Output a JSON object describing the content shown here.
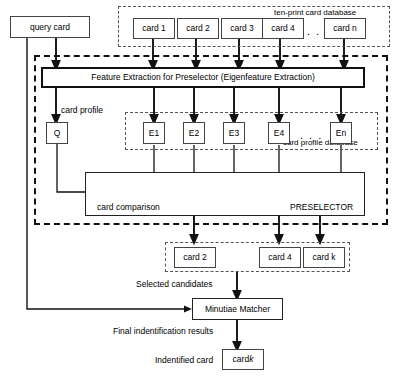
{
  "diagram": {
    "accent": "#000000",
    "box_border": "#444444",
    "dash_border": "#555555"
  },
  "query": {
    "card_label": "query card"
  },
  "tenprint_db": {
    "title": "ten-print card database",
    "cards": [
      {
        "label": "card 1"
      },
      {
        "label": "card 2"
      },
      {
        "label": "card 3"
      },
      {
        "label": "card 4"
      },
      {
        "label": "card n"
      }
    ],
    "ellipsis": ". . ."
  },
  "feature_extraction": {
    "label": "Feature Extraction for Preselector (Eigenfeature Extraction)"
  },
  "profiles": {
    "card_profile_label": "card profile",
    "query_profile": "Q",
    "db_title": "card profile database",
    "entries": [
      {
        "label": "E1"
      },
      {
        "label": "E2"
      },
      {
        "label": "E3"
      },
      {
        "label": "E4"
      },
      {
        "label": "En"
      }
    ],
    "ellipsis": ". . ."
  },
  "preselector": {
    "name": "PRESELECTOR",
    "comparison_label": "card comparison",
    "compare_symbol": "⊗"
  },
  "candidates": {
    "caption": "Selected candidates",
    "cards": [
      {
        "label": "card 2"
      },
      {
        "label": "card 4"
      },
      {
        "label": "card k"
      }
    ]
  },
  "matcher": {
    "label": "Minutiae Matcher",
    "results_caption": "Final indentification results"
  },
  "result": {
    "caption": "Indentified card",
    "card_prefix": "card ",
    "card_suffix": "k"
  }
}
